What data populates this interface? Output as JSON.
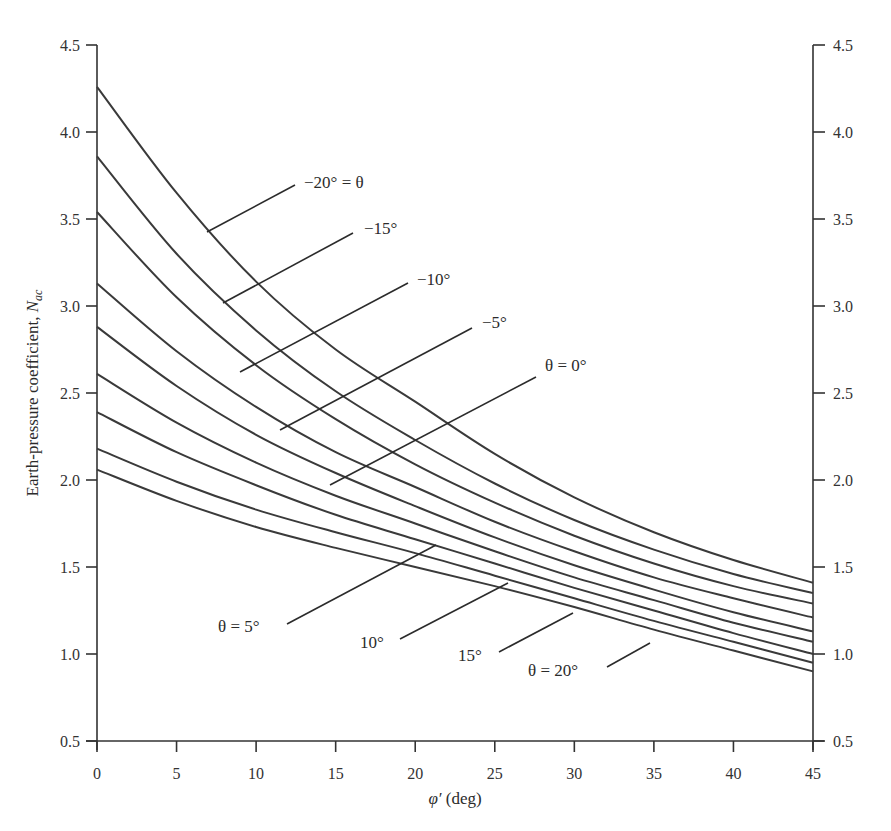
{
  "chart_data": {
    "type": "line",
    "title": "",
    "xlabel": "φ′ (deg)",
    "ylabel": "Earth-pressure coefficient, N_ac",
    "xlim": [
      0,
      45
    ],
    "ylim": [
      0.5,
      4.5
    ],
    "grid": false,
    "legend_position": "inline labels with leader lines",
    "x_ticks": [
      "0",
      "5",
      "10",
      "15",
      "20",
      "25",
      "30",
      "35",
      "40",
      "45"
    ],
    "y_ticks_left": [
      "0.5",
      "1.0",
      "1.5",
      "2.0",
      "2.5",
      "3.0",
      "3.5",
      "4.0",
      "4.5"
    ],
    "y_ticks_right": [
      "0.5",
      "1.0",
      "1.5",
      "2.0",
      "2.5",
      "3.0",
      "3.5",
      "4.0",
      "4.5"
    ],
    "x": [
      0,
      5,
      10,
      15,
      20,
      25,
      30,
      35,
      40,
      45
    ],
    "series": [
      {
        "name": "θ = −20°",
        "label": "−20° = θ",
        "values": [
          4.26,
          3.65,
          3.14,
          2.75,
          2.45,
          2.15,
          1.9,
          1.7,
          1.54,
          1.41
        ]
      },
      {
        "name": "θ = −15°",
        "label": "−15°",
        "values": [
          3.86,
          3.3,
          2.86,
          2.51,
          2.23,
          1.98,
          1.77,
          1.6,
          1.46,
          1.35
        ]
      },
      {
        "name": "θ = −10°",
        "label": "−10°",
        "values": [
          3.54,
          3.05,
          2.66,
          2.35,
          2.09,
          1.87,
          1.68,
          1.52,
          1.39,
          1.29
        ]
      },
      {
        "name": "θ = −5°",
        "label": "−5°",
        "values": [
          3.13,
          2.74,
          2.42,
          2.16,
          1.96,
          1.76,
          1.59,
          1.44,
          1.32,
          1.21
        ]
      },
      {
        "name": "θ = 0°",
        "label": "θ = 0°",
        "values": [
          2.88,
          2.54,
          2.26,
          2.04,
          1.85,
          1.67,
          1.51,
          1.37,
          1.24,
          1.13
        ]
      },
      {
        "name": "θ = 5°",
        "label": "θ = 5°",
        "values": [
          2.61,
          2.33,
          2.1,
          1.91,
          1.75,
          1.59,
          1.44,
          1.31,
          1.18,
          1.07
        ]
      },
      {
        "name": "θ = 10°",
        "label": "10°",
        "values": [
          2.39,
          2.16,
          1.97,
          1.8,
          1.66,
          1.52,
          1.38,
          1.25,
          1.12,
          1.0
        ]
      },
      {
        "name": "θ = 15°",
        "label": "15°",
        "values": [
          2.18,
          1.99,
          1.83,
          1.7,
          1.58,
          1.45,
          1.32,
          1.19,
          1.07,
          0.95
        ]
      },
      {
        "name": "θ = 20°",
        "label": "θ = 20°",
        "values": [
          2.06,
          1.88,
          1.73,
          1.61,
          1.5,
          1.39,
          1.27,
          1.14,
          1.02,
          0.9
        ]
      }
    ]
  },
  "labels": {
    "ylabel_main": "Earth-pressure coefficient, ",
    "ylabel_symbol": "N",
    "ylabel_sub": "ac",
    "xlabel_symbol": "φ′",
    "xlabel_unit": " (deg)",
    "curve_m20": "−20° = θ",
    "curve_m15": "−15°",
    "curve_m10": "−10°",
    "curve_m5": "−5°",
    "curve_0": "θ = 0°",
    "curve_5": "θ = 5°",
    "curve_10": "10°",
    "curve_15": "15°",
    "curve_20": "θ = 20°"
  },
  "colors": {
    "line": "#3a3a3a",
    "background": "#ffffff",
    "text": "#2b2b2b"
  }
}
